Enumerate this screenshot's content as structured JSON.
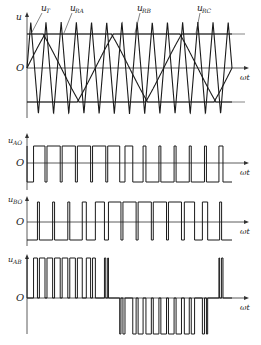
{
  "diagram": {
    "colors": {
      "stroke": "#1a1a1a",
      "axis": "#333333",
      "background": "#ffffff"
    },
    "carrier": {
      "label_main": "u",
      "label_sub": "T",
      "periods": 13.5,
      "type": "triangle"
    },
    "references": [
      {
        "id": "A",
        "label_main": "u",
        "label_sub": "RA",
        "phase_deg": 0
      },
      {
        "id": "B",
        "label_main": "u",
        "label_sub": "RB",
        "phase_deg": -120
      },
      {
        "id": "C",
        "label_main": "u",
        "label_sub": "RC",
        "phase_deg": 120
      }
    ],
    "modulation": {
      "amplitude": 1.9,
      "clip": 1.0,
      "carrier_peak": 1.35
    },
    "panels": [
      {
        "id": "top",
        "y_label": "u",
        "origin_label": "O",
        "x_label": "ωt"
      },
      {
        "id": "uAO",
        "y_label_main": "u",
        "y_label_sub": "AO",
        "origin_label": "O",
        "x_label": "ωt"
      },
      {
        "id": "uBO",
        "y_label_main": "u",
        "y_label_sub": "BO",
        "origin_label": "O",
        "x_label": "ωt"
      },
      {
        "id": "uAB",
        "y_label_main": "u",
        "y_label_sub": "AB",
        "origin_label": "O",
        "x_label": "ωt"
      }
    ]
  }
}
